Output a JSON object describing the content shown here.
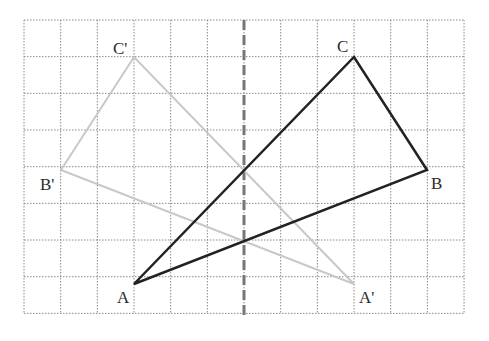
{
  "diagram": {
    "type": "reflection-on-grid",
    "grid": {
      "columns": 12,
      "rows": 8,
      "origin_px": [
        24,
        20
      ],
      "cell_px": 36.67,
      "line_color": "#8a8a8a"
    },
    "axis": {
      "x_px": 244,
      "style": "dashed",
      "color": "#777777"
    },
    "original_triangle": {
      "color": "#222222",
      "vertices": [
        {
          "name": "A",
          "grid": [
            3,
            7
          ]
        },
        {
          "name": "B",
          "grid": [
            11,
            4
          ]
        },
        {
          "name": "C",
          "grid": [
            9,
            1
          ]
        }
      ]
    },
    "image_triangle": {
      "color": "#c8c8c8",
      "vertices": [
        {
          "name": "A'",
          "grid": [
            9,
            7
          ]
        },
        {
          "name": "B'",
          "grid": [
            1,
            4
          ]
        },
        {
          "name": "C'",
          "grid": [
            3,
            1
          ]
        }
      ]
    },
    "labels": {
      "A": "A",
      "B": "B",
      "C": "C",
      "A_prime": "A'",
      "B_prime": "B'",
      "C_prime": "C'"
    }
  }
}
